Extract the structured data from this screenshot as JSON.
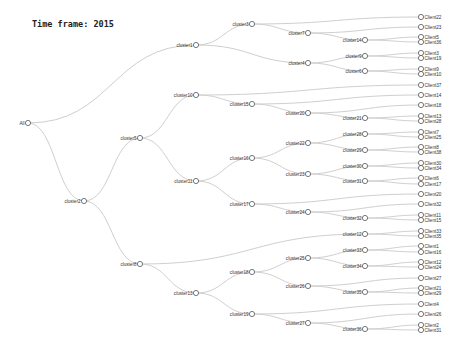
{
  "header": {
    "title": "Time frame: 2015"
  },
  "tree": {
    "nodes": [
      {
        "id": "All",
        "label": "All",
        "x": 28,
        "y": 123,
        "parent": null
      },
      {
        "id": "cluster2",
        "label": "cluster2",
        "x": 84,
        "y": 201,
        "parent": "All"
      },
      {
        "id": "cluster5",
        "label": "cluster5",
        "x": 140,
        "y": 138,
        "parent": "cluster2"
      },
      {
        "id": "cluster8",
        "label": "cluster8",
        "x": 140,
        "y": 264,
        "parent": "cluster2"
      },
      {
        "id": "cluster1",
        "label": "cluster1",
        "x": 196,
        "y": 45,
        "parent": "All"
      },
      {
        "id": "cluster10",
        "label": "cluster10",
        "x": 196,
        "y": 95,
        "parent": "cluster5"
      },
      {
        "id": "cluster11",
        "label": "cluster11",
        "x": 196,
        "y": 181,
        "parent": "cluster5"
      },
      {
        "id": "cluster13",
        "label": "cluster13",
        "x": 196,
        "y": 293,
        "parent": "cluster8"
      },
      {
        "id": "cluster3",
        "label": "cluster3",
        "x": 252,
        "y": 24,
        "parent": "cluster1"
      },
      {
        "id": "cluster15",
        "label": "cluster15",
        "x": 252,
        "y": 104,
        "parent": "cluster10"
      },
      {
        "id": "cluster16",
        "label": "cluster16",
        "x": 252,
        "y": 158,
        "parent": "cluster11"
      },
      {
        "id": "cluster17",
        "label": "cluster17",
        "x": 252,
        "y": 204,
        "parent": "cluster11"
      },
      {
        "id": "cluster18",
        "label": "cluster18",
        "x": 252,
        "y": 272,
        "parent": "cluster13"
      },
      {
        "id": "cluster19",
        "label": "cluster19",
        "x": 252,
        "y": 314,
        "parent": "cluster13"
      },
      {
        "id": "cluster7",
        "label": "cluster7",
        "x": 308,
        "y": 33,
        "parent": "cluster3"
      },
      {
        "id": "cluster4",
        "label": "cluster4",
        "x": 308,
        "y": 63,
        "parent": "cluster1"
      },
      {
        "id": "cluster20",
        "label": "cluster20",
        "x": 308,
        "y": 113,
        "parent": "cluster15"
      },
      {
        "id": "cluster22",
        "label": "cluster22",
        "x": 308,
        "y": 143,
        "parent": "cluster16"
      },
      {
        "id": "cluster23",
        "label": "cluster23",
        "x": 308,
        "y": 174,
        "parent": "cluster16"
      },
      {
        "id": "cluster24",
        "label": "cluster24",
        "x": 308,
        "y": 212,
        "parent": "cluster17"
      },
      {
        "id": "cluster25",
        "label": "cluster25",
        "x": 308,
        "y": 258,
        "parent": "cluster18"
      },
      {
        "id": "cluster26",
        "label": "cluster26",
        "x": 308,
        "y": 286,
        "parent": "cluster18"
      },
      {
        "id": "cluster27",
        "label": "cluster27",
        "x": 308,
        "y": 323,
        "parent": "cluster19"
      },
      {
        "id": "cluster14",
        "label": "cluster14",
        "x": 365,
        "y": 40,
        "parent": "cluster7"
      },
      {
        "id": "cluster9",
        "label": "cluster9",
        "x": 365,
        "y": 56,
        "parent": "cluster4"
      },
      {
        "id": "cluster6",
        "label": "cluster6",
        "x": 365,
        "y": 71,
        "parent": "cluster4"
      },
      {
        "id": "cluster21",
        "label": "cluster21",
        "x": 365,
        "y": 118,
        "parent": "cluster20"
      },
      {
        "id": "cluster28",
        "label": "cluster28",
        "x": 365,
        "y": 134,
        "parent": "cluster22"
      },
      {
        "id": "cluster29",
        "label": "cluster29",
        "x": 365,
        "y": 150,
        "parent": "cluster22"
      },
      {
        "id": "cluster30",
        "label": "cluster30",
        "x": 365,
        "y": 166,
        "parent": "cluster23"
      },
      {
        "id": "cluster31",
        "label": "cluster31",
        "x": 365,
        "y": 181,
        "parent": "cluster23"
      },
      {
        "id": "cluster32",
        "label": "cluster32",
        "x": 365,
        "y": 218,
        "parent": "cluster24"
      },
      {
        "id": "cluster12",
        "label": "cluster12",
        "x": 365,
        "y": 234,
        "parent": "cluster8"
      },
      {
        "id": "cluster33",
        "label": "cluster33",
        "x": 365,
        "y": 250,
        "parent": "cluster25"
      },
      {
        "id": "cluster34",
        "label": "cluster34",
        "x": 365,
        "y": 266,
        "parent": "cluster25"
      },
      {
        "id": "cluster35",
        "label": "cluster35",
        "x": 365,
        "y": 292,
        "parent": "cluster26"
      },
      {
        "id": "cluster36",
        "label": "cluster36",
        "x": 365,
        "y": 329,
        "parent": "cluster27"
      },
      {
        "id": "Client22",
        "label": "Client22",
        "x": 421,
        "y": 17,
        "parent": "cluster3"
      },
      {
        "id": "Client23",
        "label": "Client23",
        "x": 421,
        "y": 27,
        "parent": "cluster7"
      },
      {
        "id": "Client5",
        "label": "Client5",
        "x": 421,
        "y": 37,
        "parent": "cluster14"
      },
      {
        "id": "Client36",
        "label": "Client36",
        "x": 421,
        "y": 42,
        "parent": "cluster14"
      },
      {
        "id": "Client3",
        "label": "Client3",
        "x": 421,
        "y": 53,
        "parent": "cluster9"
      },
      {
        "id": "Client19",
        "label": "Client19",
        "x": 421,
        "y": 58,
        "parent": "cluster9"
      },
      {
        "id": "Client9",
        "label": "Client9",
        "x": 421,
        "y": 69,
        "parent": "cluster6"
      },
      {
        "id": "Client10",
        "label": "Client10",
        "x": 421,
        "y": 74,
        "parent": "cluster6"
      },
      {
        "id": "Client37",
        "label": "Client37",
        "x": 421,
        "y": 85,
        "parent": "cluster10"
      },
      {
        "id": "Client14",
        "label": "Client14",
        "x": 421,
        "y": 95,
        "parent": "cluster15"
      },
      {
        "id": "Client18",
        "label": "Client18",
        "x": 421,
        "y": 105,
        "parent": "cluster20"
      },
      {
        "id": "Client13",
        "label": "Client13",
        "x": 421,
        "y": 116,
        "parent": "cluster21"
      },
      {
        "id": "Client28",
        "label": "Client28",
        "x": 421,
        "y": 121,
        "parent": "cluster21"
      },
      {
        "id": "Client7",
        "label": "Client7",
        "x": 421,
        "y": 132,
        "parent": "cluster28"
      },
      {
        "id": "Client25",
        "label": "Client25",
        "x": 421,
        "y": 137,
        "parent": "cluster28"
      },
      {
        "id": "Client8",
        "label": "Client8",
        "x": 421,
        "y": 147,
        "parent": "cluster29"
      },
      {
        "id": "Client38",
        "label": "Client38",
        "x": 421,
        "y": 152,
        "parent": "cluster29"
      },
      {
        "id": "Client30",
        "label": "Client30",
        "x": 421,
        "y": 163,
        "parent": "cluster30"
      },
      {
        "id": "Client34",
        "label": "Client34",
        "x": 421,
        "y": 168,
        "parent": "cluster30"
      },
      {
        "id": "Client6",
        "label": "Client6",
        "x": 421,
        "y": 178,
        "parent": "cluster31"
      },
      {
        "id": "Client17",
        "label": "Client17",
        "x": 421,
        "y": 184,
        "parent": "cluster31"
      },
      {
        "id": "Client20",
        "label": "Client20",
        "x": 421,
        "y": 194,
        "parent": "cluster17"
      },
      {
        "id": "Client32",
        "label": "Client32",
        "x": 421,
        "y": 204,
        "parent": "cluster24"
      },
      {
        "id": "Client11",
        "label": "Client11",
        "x": 421,
        "y": 215,
        "parent": "cluster32"
      },
      {
        "id": "Client15",
        "label": "Client15",
        "x": 421,
        "y": 220,
        "parent": "cluster32"
      },
      {
        "id": "Client33",
        "label": "Client33",
        "x": 421,
        "y": 231,
        "parent": "cluster12"
      },
      {
        "id": "Client35",
        "label": "Client35",
        "x": 421,
        "y": 236,
        "parent": "cluster12"
      },
      {
        "id": "Client1",
        "label": "Client1",
        "x": 421,
        "y": 246,
        "parent": "cluster33"
      },
      {
        "id": "Client16",
        "label": "Client16",
        "x": 421,
        "y": 252,
        "parent": "cluster33"
      },
      {
        "id": "Client12",
        "label": "Client12",
        "x": 421,
        "y": 262,
        "parent": "cluster34"
      },
      {
        "id": "Client24",
        "label": "Client24",
        "x": 421,
        "y": 267,
        "parent": "cluster34"
      },
      {
        "id": "Client27",
        "label": "Client27",
        "x": 421,
        "y": 278,
        "parent": "cluster26"
      },
      {
        "id": "Client21",
        "label": "Client21",
        "x": 421,
        "y": 288,
        "parent": "cluster35"
      },
      {
        "id": "Client29",
        "label": "Client29",
        "x": 421,
        "y": 293,
        "parent": "cluster35"
      },
      {
        "id": "Client4",
        "label": "Client4",
        "x": 421,
        "y": 304,
        "parent": "cluster19"
      },
      {
        "id": "Client26",
        "label": "Client26",
        "x": 421,
        "y": 314,
        "parent": "cluster27"
      },
      {
        "id": "Client2",
        "label": "Client2",
        "x": 421,
        "y": 325,
        "parent": "cluster36"
      },
      {
        "id": "Client31",
        "label": "Client31",
        "x": 421,
        "y": 330,
        "parent": "cluster36"
      }
    ]
  }
}
